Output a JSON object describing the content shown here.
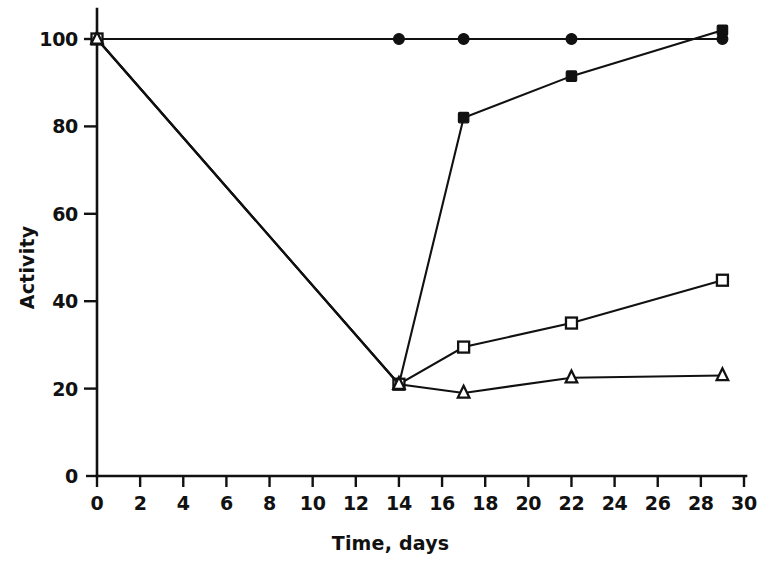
{
  "chart_data": {
    "type": "line",
    "title": "",
    "subtitle": "",
    "xlabel": "Time, days",
    "ylabel": "Activity",
    "xlim": [
      0,
      30
    ],
    "ylim": [
      0,
      105
    ],
    "xticks": [
      0,
      2,
      4,
      6,
      8,
      10,
      12,
      14,
      16,
      18,
      20,
      22,
      24,
      26,
      28,
      30
    ],
    "xticklabels": [
      "0",
      "2",
      "4",
      "6",
      "8",
      "10",
      "12",
      "14",
      "16",
      "18",
      "20",
      "22",
      "24",
      "26",
      "28",
      "30"
    ],
    "yticks": [
      0,
      20,
      40,
      60,
      80,
      100
    ],
    "yticklabels": [
      "0",
      "20",
      "40",
      "60",
      "80",
      "100"
    ],
    "grid": false,
    "legend": "none",
    "legend_visible": false,
    "annotations": [],
    "line_color": "#111111",
    "background_color": "#ffffff",
    "series": [
      {
        "name": "filled-circle",
        "marker": "filled-circle",
        "marker_glyph": "●",
        "x": [
          0,
          14,
          17,
          22,
          29
        ],
        "values": [
          100,
          100,
          100,
          100,
          100
        ]
      },
      {
        "name": "filled-square",
        "marker": "filled-square",
        "marker_glyph": "■",
        "x": [
          0,
          14,
          17,
          22,
          29
        ],
        "values": [
          100,
          21,
          82,
          91.5,
          102
        ]
      },
      {
        "name": "open-square",
        "marker": "open-square",
        "marker_glyph": "□",
        "x": [
          0,
          14,
          17,
          22,
          29
        ],
        "values": [
          100,
          21,
          29.5,
          35,
          44.8
        ]
      },
      {
        "name": "open-triangle",
        "marker": "open-triangle",
        "marker_glyph": "△",
        "x": [
          0,
          14,
          17,
          22,
          29
        ],
        "values": [
          100,
          21,
          19,
          22.5,
          23
        ]
      }
    ]
  },
  "layout": {
    "plot_left_px": 97,
    "plot_right_px": 744,
    "plot_bottom_px": 476,
    "plot_top_px": 39,
    "y_value_at_top_px": 105
  }
}
